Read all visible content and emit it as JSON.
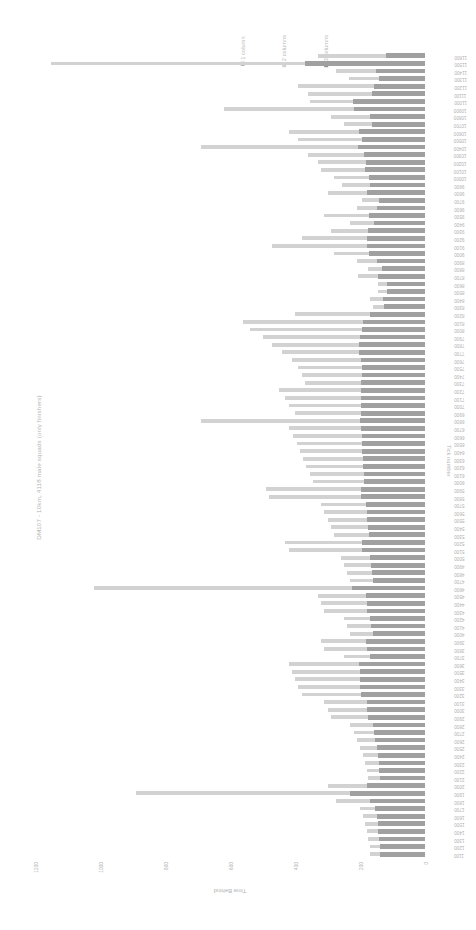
{
  "chart_data": {
    "type": "bar",
    "orientation": "horizontal",
    "title": "DM107 - 10km, 4118 male squads (only finishers)",
    "xlabel": "Time Behind",
    "ylabel": "Tick number",
    "xlim": [
      1200,
      0
    ],
    "xticks": [
      "1200",
      "1000",
      "800",
      "600",
      "400",
      "200",
      "0"
    ],
    "grid": false,
    "legend_position": "top",
    "legend": [
      {
        "name": "1 column",
        "color": "#a0a0a0"
      },
      {
        "name": "2 columns",
        "color": "#d2d2d2"
      },
      {
        "name": "3 columns",
        "color": "#8f8f8f"
      }
    ],
    "categories": [
      "11600",
      "11500",
      "11400",
      "11300",
      "11200",
      "11100",
      "11000",
      "10900",
      "10800",
      "10700",
      "10600",
      "10500",
      "10400",
      "10300",
      "10200",
      "10100",
      "10000",
      "9900",
      "9800",
      "9700",
      "9600",
      "9500",
      "9400",
      "9300",
      "9200",
      "9100",
      "9000",
      "8900",
      "8800",
      "8700",
      "8600",
      "8500",
      "8400",
      "8300",
      "8200",
      "8100",
      "8000",
      "7900",
      "7800",
      "7700",
      "7600",
      "7500",
      "7400",
      "7300",
      "7200",
      "7100",
      "7000",
      "6900",
      "6800",
      "6700",
      "6600",
      "6500",
      "6400",
      "6300",
      "6200",
      "6100",
      "6000",
      "5900",
      "5800",
      "5700",
      "5600",
      "5500",
      "5400",
      "5300",
      "5200",
      "5100",
      "5000",
      "4900",
      "4800",
      "4700",
      "4600",
      "4500",
      "4400",
      "4300",
      "4200",
      "4100",
      "4000",
      "3900",
      "3800",
      "3700",
      "3600",
      "3500",
      "3400",
      "3300",
      "3200",
      "3100",
      "3000",
      "2900",
      "2800",
      "2700",
      "2600",
      "2500",
      "2400",
      "2300",
      "2200",
      "2100",
      "2000",
      "1900",
      "1800",
      "1700",
      "1600",
      "1500",
      "1400",
      "1300",
      "1200",
      "1100"
    ],
    "values": [
      330,
      1150,
      275,
      235,
      390,
      360,
      355,
      620,
      290,
      250,
      420,
      390,
      690,
      360,
      330,
      320,
      280,
      255,
      300,
      195,
      210,
      310,
      230,
      290,
      380,
      470,
      280,
      210,
      175,
      205,
      145,
      145,
      170,
      160,
      400,
      560,
      540,
      500,
      470,
      440,
      410,
      390,
      380,
      370,
      450,
      430,
      420,
      400,
      690,
      420,
      405,
      395,
      385,
      375,
      365,
      355,
      345,
      490,
      480,
      320,
      310,
      300,
      290,
      280,
      430,
      420,
      260,
      250,
      240,
      230,
      1020,
      330,
      320,
      310,
      250,
      240,
      230,
      320,
      310,
      250,
      420,
      410,
      400,
      390,
      380,
      310,
      300,
      290,
      230,
      220,
      210,
      200,
      190,
      185,
      180,
      175,
      300,
      890,
      275,
      200,
      190,
      185,
      180,
      175,
      170,
      168
    ],
    "series_colors": [
      "#a0a0a0",
      "#d2d2d2",
      "#8f8f8f"
    ],
    "series_split": [
      [
        0.36,
        0.64
      ],
      [
        0.32,
        0.68
      ],
      [
        0.55,
        0.45
      ],
      [
        0.6,
        0.4
      ],
      [
        0.4,
        0.6
      ],
      [
        0.45,
        0.55
      ],
      [
        0.62,
        0.38
      ],
      [
        0.35,
        0.65
      ],
      [
        0.58,
        0.42
      ],
      [
        0.65,
        0.35
      ],
      [
        0.48,
        0.52
      ],
      [
        0.5,
        0.5
      ],
      [
        0.3,
        0.7
      ],
      [
        0.52,
        0.48
      ],
      [
        0.55,
        0.45
      ],
      [
        0.58,
        0.42
      ],
      [
        0.62,
        0.38
      ],
      [
        0.66,
        0.34
      ],
      [
        0.6,
        0.4
      ],
      [
        0.72,
        0.28
      ],
      [
        0.7,
        0.3
      ],
      [
        0.56,
        0.44
      ],
      [
        0.68,
        0.32
      ],
      [
        0.6,
        0.4
      ],
      [
        0.47,
        0.53
      ],
      [
        0.38,
        0.62
      ],
      [
        0.62,
        0.38
      ],
      [
        0.7,
        0.3
      ],
      [
        0.75,
        0.25
      ],
      [
        0.71,
        0.29
      ],
      [
        0.8,
        0.2
      ],
      [
        0.8,
        0.2
      ],
      [
        0.76,
        0.24
      ],
      [
        0.78,
        0.22
      ],
      [
        0.42,
        0.58
      ],
      [
        0.34,
        0.66
      ],
      [
        0.36,
        0.64
      ],
      [
        0.4,
        0.6
      ],
      [
        0.43,
        0.57
      ],
      [
        0.46,
        0.54
      ],
      [
        0.48,
        0.52
      ],
      [
        0.5,
        0.5
      ],
      [
        0.51,
        0.49
      ],
      [
        0.53,
        0.47
      ],
      [
        0.44,
        0.56
      ],
      [
        0.46,
        0.54
      ],
      [
        0.47,
        0.53
      ],
      [
        0.49,
        0.51
      ],
      [
        0.29,
        0.71
      ],
      [
        0.47,
        0.53
      ],
      [
        0.48,
        0.52
      ],
      [
        0.49,
        0.51
      ],
      [
        0.5,
        0.5
      ],
      [
        0.51,
        0.49
      ],
      [
        0.52,
        0.48
      ],
      [
        0.53,
        0.47
      ],
      [
        0.54,
        0.46
      ],
      [
        0.4,
        0.6
      ],
      [
        0.41,
        0.59
      ],
      [
        0.57,
        0.43
      ],
      [
        0.58,
        0.42
      ],
      [
        0.59,
        0.41
      ],
      [
        0.6,
        0.4
      ],
      [
        0.62,
        0.38
      ],
      [
        0.45,
        0.55
      ],
      [
        0.46,
        0.54
      ],
      [
        0.65,
        0.35
      ],
      [
        0.66,
        0.34
      ],
      [
        0.68,
        0.32
      ],
      [
        0.69,
        0.31
      ],
      [
        0.22,
        0.78
      ],
      [
        0.55,
        0.45
      ],
      [
        0.56,
        0.44
      ],
      [
        0.58,
        0.42
      ],
      [
        0.68,
        0.32
      ],
      [
        0.69,
        0.31
      ],
      [
        0.7,
        0.3
      ],
      [
        0.57,
        0.43
      ],
      [
        0.58,
        0.42
      ],
      [
        0.68,
        0.32
      ],
      [
        0.48,
        0.52
      ],
      [
        0.49,
        0.51
      ],
      [
        0.5,
        0.5
      ],
      [
        0.51,
        0.49
      ],
      [
        0.52,
        0.48
      ],
      [
        0.58,
        0.42
      ],
      [
        0.59,
        0.41
      ],
      [
        0.61,
        0.39
      ],
      [
        0.7,
        0.3
      ],
      [
        0.71,
        0.29
      ],
      [
        0.73,
        0.27
      ],
      [
        0.74,
        0.26
      ],
      [
        0.76,
        0.24
      ],
      [
        0.77,
        0.23
      ],
      [
        0.78,
        0.22
      ],
      [
        0.79,
        0.21
      ],
      [
        0.6,
        0.4
      ],
      [
        0.26,
        0.74
      ],
      [
        0.62,
        0.38
      ],
      [
        0.77,
        0.23
      ],
      [
        0.78,
        0.22
      ],
      [
        0.79,
        0.21
      ],
      [
        0.8,
        0.2
      ],
      [
        0.81,
        0.19
      ],
      [
        0.82,
        0.18
      ],
      [
        0.83,
        0.17
      ]
    ]
  }
}
